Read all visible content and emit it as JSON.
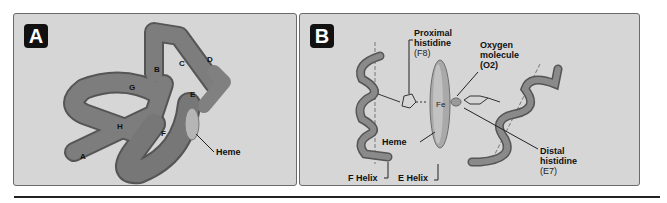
{
  "panel_a": {
    "badge": "A",
    "helix_labels": [
      "A",
      "B",
      "C",
      "D",
      "E",
      "F",
      "G",
      "H"
    ],
    "heme_label": "Heme"
  },
  "panel_b": {
    "badge": "B",
    "proximal": {
      "line1": "Proximal",
      "line2": "histidine",
      "line3": "(F8)"
    },
    "oxygen": {
      "line1": "Oxygen",
      "line2": "molecule",
      "line3": "(O2)"
    },
    "iron_label": "Fe",
    "heme_label": "Heme",
    "distal": {
      "line1": "Distal",
      "line2": "histidine",
      "line3": "(E7)"
    },
    "f_helix": "F Helix",
    "e_helix": "E Helix"
  },
  "colors": {
    "panel_bg": "#d6d6d6",
    "tube": "#7d7d7d",
    "tube_dark": "#555555",
    "heme": "#b0b0b0",
    "badge_bg": "#111111"
  }
}
